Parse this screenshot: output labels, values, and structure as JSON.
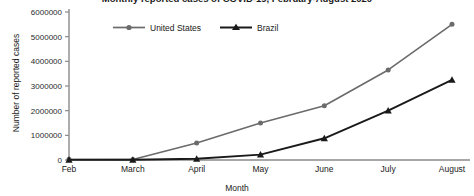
{
  "chart_data": {
    "type": "line",
    "title": "Monthly reported cases of COVID-19, February-August 2020",
    "xlabel": "Month",
    "ylabel": "Number of reported cases",
    "categories": [
      "Feb",
      "March",
      "April",
      "May",
      "June",
      "July",
      "August"
    ],
    "ylim": [
      0,
      6000000
    ],
    "ytick_labels": [
      "0",
      "1000000",
      "2000000",
      "3000000",
      "4000000",
      "5000000",
      "6000000"
    ],
    "ytick_values": [
      0,
      1000000,
      2000000,
      3000000,
      4000000,
      5000000,
      6000000
    ],
    "grid": false,
    "legend_position": "top-left",
    "series": [
      {
        "name": "United States",
        "color": "#6b6b6b",
        "marker": "circle",
        "values": [
          30000,
          20000,
          690000,
          1500000,
          2200000,
          3650000,
          5500000
        ]
      },
      {
        "name": "Brazil",
        "color": "#1a1a1a",
        "marker": "triangle",
        "values": [
          5000,
          10000,
          50000,
          220000,
          880000,
          2000000,
          3250000
        ]
      }
    ]
  },
  "axis": {
    "line_color": "#8a8a8a"
  }
}
